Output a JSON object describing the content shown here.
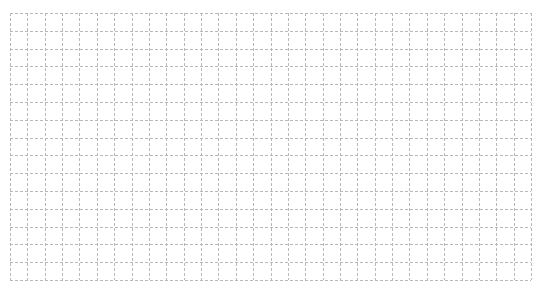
{
  "grid": {
    "columns": 30,
    "rows": 15,
    "line_color": "#b8b8b8",
    "line_style": "dashed",
    "background_color": "#ffffff"
  }
}
